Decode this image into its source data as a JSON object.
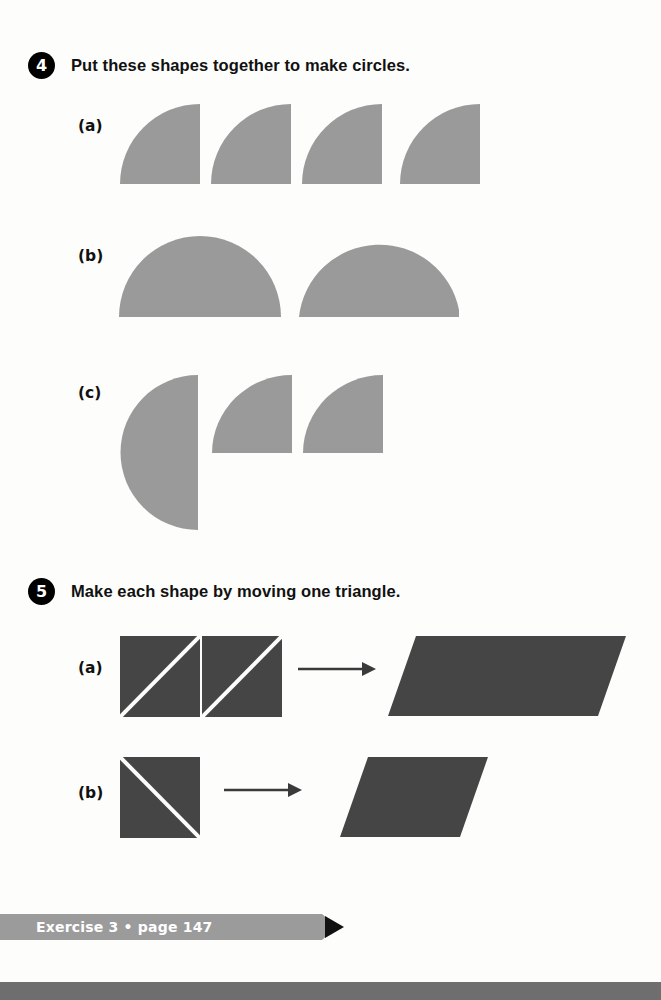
{
  "page": {
    "background_color": "#fdfdfb",
    "width": 661,
    "height": 1000
  },
  "colors": {
    "shape_gray": "#9a9a9a",
    "shape_dark": "#454545",
    "badge_black": "#000000",
    "banner_gray": "#9b9b9b",
    "bottom_strip": "#6e6e6e",
    "text_black": "#111111",
    "diagonal_white": "#fdfdfb"
  },
  "problems": [
    {
      "number": "4",
      "instruction": "Put these shapes together to make circles.",
      "parts": [
        {
          "label": "(a)",
          "shapes": [
            {
              "kind": "quarter-circle",
              "orientation": "curve-top-left",
              "count": 4,
              "size": 80
            }
          ],
          "description": "four identical quarter circles"
        },
        {
          "label": "(b)",
          "shapes": [
            {
              "kind": "semicircle",
              "orientation": "flat-bottom",
              "count": 2,
              "width": 160,
              "height": 80
            }
          ],
          "description": "two half circles with flat bottoms"
        },
        {
          "label": "(c)",
          "shapes": [
            {
              "kind": "semicircle",
              "orientation": "flat-right",
              "count": 1,
              "width": 78,
              "height": 154
            },
            {
              "kind": "quarter-circle",
              "orientation": "curve-top-left",
              "count": 2,
              "size": 80
            }
          ],
          "description": "one half circle and two quarter circles"
        }
      ]
    },
    {
      "number": "5",
      "instruction": "Make each shape by moving one triangle.",
      "parts": [
        {
          "label": "(a)",
          "source": {
            "kind": "squares-with-diagonal",
            "count": 2,
            "diagonal": "bottom-left-to-top-right",
            "size": 80
          },
          "arrow": "right-arrow",
          "result": {
            "kind": "parallelogram",
            "slant": "right",
            "width": 210,
            "height": 78
          }
        },
        {
          "label": "(b)",
          "source": {
            "kind": "squares-with-diagonal",
            "count": 1,
            "diagonal": "top-left-to-bottom-right",
            "size": 80
          },
          "arrow": "right-arrow",
          "result": {
            "kind": "parallelogram",
            "slant": "right",
            "width": 120,
            "height": 78
          }
        }
      ]
    }
  ],
  "footer": {
    "exercise_label": "Exercise 3",
    "separator": "•",
    "page_label": "page 147",
    "full_text": "Exercise 3 • page 147"
  }
}
